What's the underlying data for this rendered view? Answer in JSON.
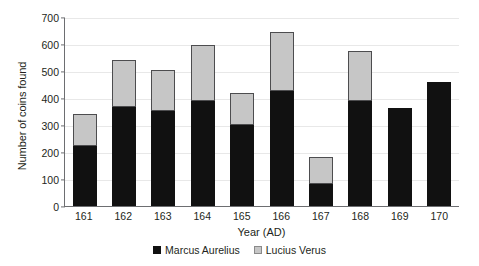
{
  "chart_data": {
    "type": "bar",
    "subtype": "stacked-vertical",
    "title": "",
    "xlabel": "Year (AD)",
    "ylabel": "Number of coins found",
    "categories": [
      "161",
      "162",
      "163",
      "164",
      "165",
      "166",
      "167",
      "168",
      "169",
      "170"
    ],
    "ylim": [
      0,
      700
    ],
    "yticks": [
      0,
      100,
      200,
      300,
      400,
      500,
      600,
      700
    ],
    "grid": true,
    "legend_position": "bottom-center",
    "series": [
      {
        "name": "Marcus Aurelius",
        "color": "#111111",
        "values": [
          222,
          367,
          352,
          389,
          300,
          425,
          81,
          389,
          363,
          460
        ]
      },
      {
        "name": "Lucius Verus",
        "color": "#c6c6c6",
        "values": [
          118,
          174,
          151,
          207,
          119,
          218,
          100,
          185,
          0,
          0
        ]
      }
    ],
    "totals": [
      340,
      541,
      503,
      596,
      419,
      643,
      181,
      574,
      363,
      460
    ]
  },
  "axes": {
    "y_title": "Number of coins found",
    "x_title": "Year (AD)",
    "y_tick_labels": [
      "700",
      "600",
      "500",
      "400",
      "300",
      "200",
      "100",
      "0"
    ],
    "x_tick_labels": [
      "161",
      "162",
      "163",
      "164",
      "165",
      "166",
      "167",
      "168",
      "169",
      "170"
    ]
  },
  "legend": {
    "items": [
      {
        "label": "Marcus Aurelius",
        "swatch_color": "#111111",
        "swatch_name": "legend-swatch-marcus-aurelius"
      },
      {
        "label": "Lucius Verus",
        "swatch_color": "#c6c6c6",
        "swatch_name": "legend-swatch-lucius-verus"
      }
    ]
  },
  "colors": {
    "marcus_aurelius": "#111111",
    "lucius_verus": "#c6c6c6",
    "axis": "#6d6e71",
    "grid": "#e8e8e8",
    "text": "#231f20",
    "background": "#ffffff"
  }
}
